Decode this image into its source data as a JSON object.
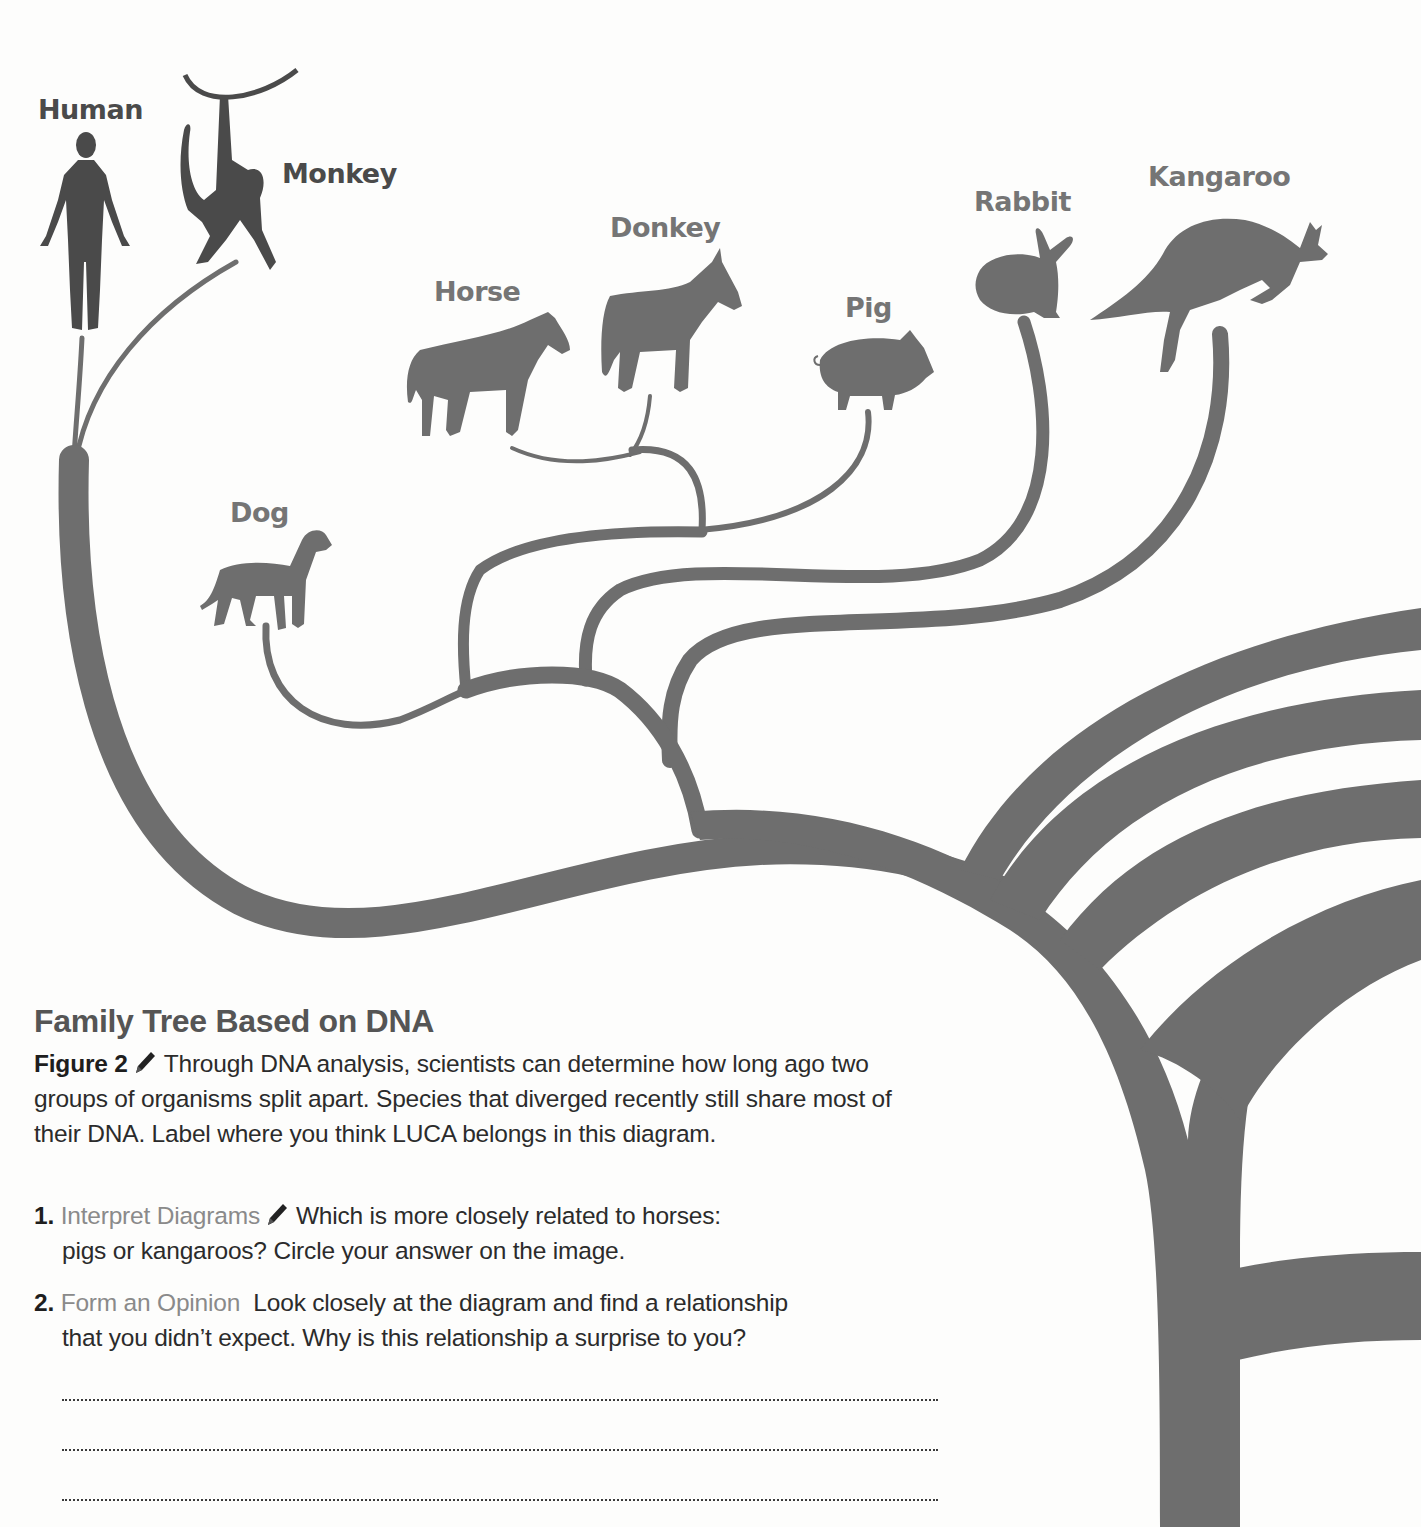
{
  "colors": {
    "tree_fill": "#6e6e6e",
    "label_dark": "#4a4a4a",
    "label_gray": "#757575",
    "skill_text": "#8a8a8a",
    "body_text": "#2b2b2b",
    "background": "#fdfdfc"
  },
  "species": [
    {
      "name": "Human",
      "icon": "human-silhouette-icon"
    },
    {
      "name": "Monkey",
      "icon": "monkey-silhouette-icon"
    },
    {
      "name": "Horse",
      "icon": "horse-silhouette-icon"
    },
    {
      "name": "Donkey",
      "icon": "donkey-silhouette-icon"
    },
    {
      "name": "Pig",
      "icon": "pig-silhouette-icon"
    },
    {
      "name": "Rabbit",
      "icon": "rabbit-silhouette-icon"
    },
    {
      "name": "Kangaroo",
      "icon": "kangaroo-silhouette-icon"
    },
    {
      "name": "Dog",
      "icon": "dog-silhouette-icon"
    }
  ],
  "figure": {
    "title": "Family Tree Based on DNA",
    "label": "Figure 2",
    "pencil_icon": "pencil-icon",
    "caption": "Through DNA analysis, scientists can determine how long ago two groups of organisms split apart. Species that diverged recently still share most of their DNA. Label where you think LUCA belongs in this diagram."
  },
  "questions": [
    {
      "number": "1.",
      "skill": "Interpret Diagrams",
      "has_pencil": true,
      "text_line1": "Which is more closely related to horses:",
      "text_line2": "pigs or kangaroos? Circle your answer on the image."
    },
    {
      "number": "2.",
      "skill": "Form an Opinion",
      "has_pencil": false,
      "text_line1": "Look closely at the diagram and find a relationship",
      "text_line2": "that you didn’t expect. Why is this relationship a surprise to you?"
    }
  ],
  "answer_lines": 3
}
